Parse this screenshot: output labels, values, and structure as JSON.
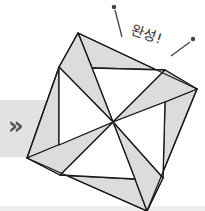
{
  "annotation": {
    "text": "완성!",
    "meaning": "Complete!"
  },
  "arrow": {
    "glyph": "»",
    "icon": "double-chevron-right-icon"
  },
  "figure": {
    "colors": {
      "fill_grey": "#dcdcdc",
      "fill_white": "#ffffff",
      "stroke": "#1a1a1a",
      "band": "#e2e2e2"
    },
    "points": {
      "center": [
        113,
        122
      ],
      "top": [
        78,
        33
      ],
      "right": [
        197,
        89
      ],
      "bottom": [
        147,
        211
      ],
      "left": [
        27,
        158
      ],
      "inner_top_left": [
        92,
        68
      ],
      "inner_top_right": [
        165,
        70
      ],
      "inner_right_bottom": [
        163,
        178
      ],
      "inner_left_top": [
        59,
        67
      ],
      "inner_left_bottom": [
        59,
        145
      ],
      "inner_bottom_left": [
        60,
        175
      ],
      "inner_bottom_right": [
        135,
        179
      ]
    }
  }
}
